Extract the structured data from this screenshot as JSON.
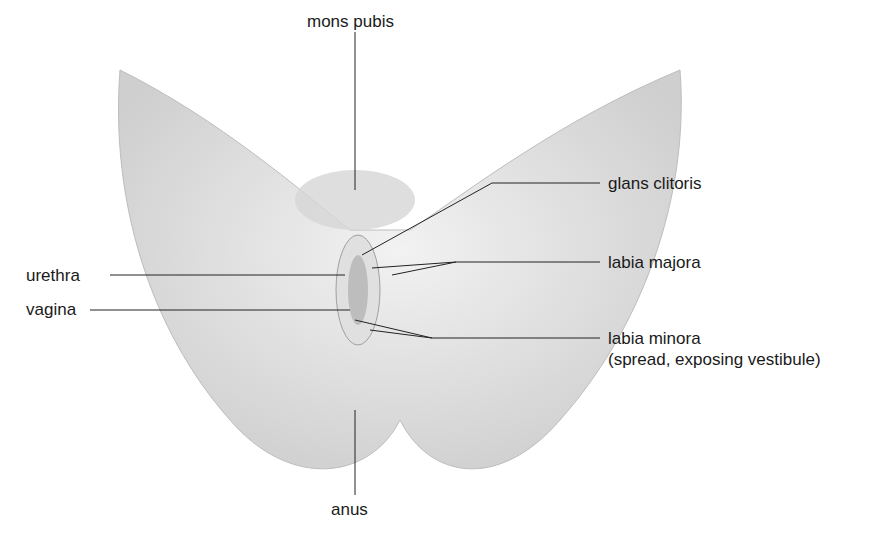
{
  "diagram": {
    "labels": {
      "top": "mons pubis",
      "bottom": "anus",
      "left_1": "urethra",
      "left_2": "vagina",
      "right_1": "glans clitoris",
      "right_2": "labia majora",
      "right_3_line1": "labia minora",
      "right_3_line2": "(spread, exposing vestibule)"
    }
  }
}
